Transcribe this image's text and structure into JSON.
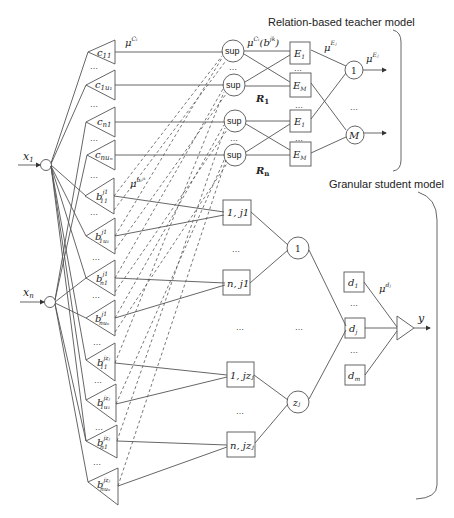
{
  "titles": {
    "teacher": "Relation-based teacher model",
    "student": "Granular student model"
  },
  "inputs": [
    {
      "label": "x",
      "sub": "1"
    },
    {
      "label": "x",
      "sub": "n"
    }
  ],
  "c_nodes": [
    {
      "base": "c",
      "sub": "11"
    },
    {
      "base": "c",
      "sub": "1u₁"
    },
    {
      "base": "c",
      "sub": "n1"
    },
    {
      "base": "c",
      "sub": "nuₙ"
    }
  ],
  "b_nodes": [
    {
      "base": "b",
      "sup": "j1",
      "sub": "11"
    },
    {
      "base": "b",
      "sup": "j1",
      "sub": "1u₁"
    },
    {
      "base": "b",
      "sup": "j1",
      "sub": "n1"
    },
    {
      "base": "b",
      "sup": "j1",
      "sub": "nuₙ"
    },
    {
      "base": "b",
      "sup": "jzⱼ",
      "sub": "11"
    },
    {
      "base": "b",
      "sup": "jzⱼ",
      "sub": "1u₁"
    },
    {
      "base": "b",
      "sup": "jzⱼ",
      "sub": "n1"
    },
    {
      "base": "b",
      "sup": "jzⱼ",
      "sub": "nuₙ"
    }
  ],
  "sup_nodes": [
    "sup",
    "sup",
    "sup",
    "sup"
  ],
  "e_nodes": [
    {
      "base": "E",
      "sub": "1"
    },
    {
      "base": "E",
      "sub": "M"
    },
    {
      "base": "E",
      "sub": "1"
    },
    {
      "base": "E",
      "sub": "M"
    }
  ],
  "relations": [
    {
      "base": "R",
      "sub": "1"
    },
    {
      "base": "R",
      "sub": "n"
    }
  ],
  "class_nodes": [
    "1",
    "M"
  ],
  "rule_nodes": [
    {
      "label": "1, j1"
    },
    {
      "label": "n, j1"
    },
    {
      "label": "1, jzⱼ"
    },
    {
      "label": "n, jzⱼ"
    }
  ],
  "agg_nodes": [
    {
      "label": "1"
    },
    {
      "label": "zⱼ"
    }
  ],
  "d_nodes": [
    {
      "base": "d",
      "sub": "1"
    },
    {
      "base": "d",
      "sub": "j"
    },
    {
      "base": "d",
      "sub": "m"
    }
  ],
  "labels": {
    "mu_c": {
      "base": "μ",
      "sup": "Cₗ"
    },
    "mu_c_b": {
      "base": "μ",
      "sup": "Cₗ",
      "rest": "(b",
      "rest_sup": "jk",
      "rest_sub": "l",
      "close": ")"
    },
    "mu_b": {
      "base": "μ",
      "sup": "bₗʲᵏ"
    },
    "mu_e_i": {
      "base": "μ",
      "sup": "Eⱼ",
      "sub": "i"
    },
    "mu_e": {
      "base": "μ",
      "sup": "Eⱼ"
    },
    "mu_d": {
      "base": "μ",
      "sup": "dⱼ"
    },
    "output": "y",
    "ellipsis": "…"
  },
  "colors": {
    "stroke": "#555555",
    "text": "#222222",
    "background": "#ffffff"
  }
}
